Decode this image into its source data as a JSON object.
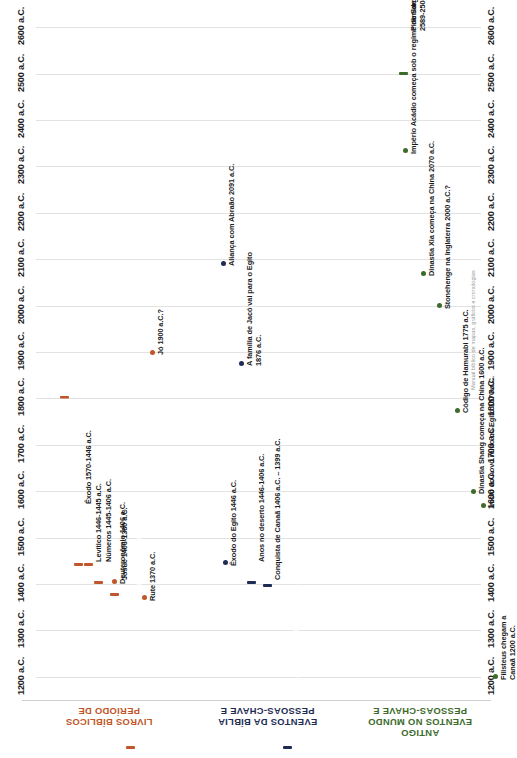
{
  "axis": {
    "unit": "a.C.",
    "ticks": [
      "1200 a.C.",
      "1300 a.C.",
      "1400 a.C.",
      "1500 a.C.",
      "1600 a.C.",
      "1700 a.C.",
      "1800 a.C.",
      "1900 a.C.",
      "2000 a.C.",
      "2100 a.C.",
      "2200 a.C.",
      "2300 a.C.",
      "2400 a.C.",
      "2500 a.C.",
      "2600 a.C."
    ],
    "tick_values": [
      1200,
      1300,
      1400,
      1500,
      1600,
      1700,
      1800,
      1900,
      2000,
      2100,
      2200,
      2300,
      2400,
      2500,
      2600
    ],
    "min": 1150,
    "max": 2620
  },
  "credit": "Manual bíblico de mapas, gráficos e cronologias",
  "rows": [
    {
      "key": "livros",
      "title": "PERÍODO DE\nLIVROS BÍBLICOS",
      "title_line1": "PERÍODO DE",
      "title_line2": "LIVROS BÍBLICOS",
      "color": "#C1562A",
      "color_light": "#D2703F"
    },
    {
      "key": "biblia",
      "title_line1": "PESSOAS-CHAVE E",
      "title_line2": "EVENTOS DA BÍBLIA",
      "color": "#1E2C54",
      "color_light": "#26345E"
    },
    {
      "key": "mundo",
      "title_line1": "PESSOAS-CHAVE E",
      "title_line2": "EVENTOS NO MUNDO",
      "title_line3": "ANTIGO",
      "color": "#3C6B2B",
      "color_light": "#4A7C33"
    }
  ],
  "chart_data": {
    "type": "bar",
    "orientation": "horizontal-time-rotated",
    "xlabel": "",
    "ylabel": "",
    "xlim": [
      2620,
      1150
    ],
    "grid": true,
    "legend": "none",
    "tick_labels": [
      "2600 a.C.",
      "2500 a.C.",
      "2400 a.C.",
      "2300 a.C.",
      "2200 a.C.",
      "2100 a.C.",
      "2000 a.C.",
      "1900 a.C.",
      "1800 a.C.",
      "1700 a.C.",
      "1600 a.C.",
      "1500 a.C.",
      "1400 a.C.",
      "1300 a.C.",
      "1200 a.C."
    ],
    "series": [
      {
        "name": "PERÍODO DE LIVROS BÍBLICOS",
        "color": "#C1562A",
        "bars": [
          {
            "label": "Origem de Gênesis – 1805 a.C.",
            "start": 2600,
            "end": 1805,
            "label_inside": true,
            "gradient": true
          },
          {
            "label": "Êxodo 1570-1446 a.C.",
            "start": 1570,
            "end": 1446,
            "label_inside": false
          },
          {
            "label": "Levítico 1446-1445 a.C.",
            "start": 1446,
            "end": 1445,
            "label_inside": false
          },
          {
            "label": "Números 1445-1406 a.C.",
            "start": 1445,
            "end": 1406,
            "label_inside": false
          },
          {
            "label": "Josué 1406-1380 a.C.",
            "start": 1406,
            "end": 1380,
            "label_inside": false
          },
          {
            "label": "Juízes 1356-1050 a.C.",
            "start": 1356,
            "end": 1050,
            "label_inside": true
          }
        ],
        "points": [
          {
            "label": "Jó 1900 a.C.?",
            "value": 1900
          },
          {
            "label": "Deuteronômio 1406 a.C.",
            "value": 1406
          },
          {
            "label": "Rute 1370 a.C.",
            "value": 1370
          }
        ]
      },
      {
        "name": "PESSOAS-CHAVE E EVENTOS DA BÍBLIA",
        "color": "#1E2C54",
        "bars": [
          {
            "label": "Anos no deserto 1446-1406 a.C.",
            "start": 1446,
            "end": 1406,
            "label_inside": false
          },
          {
            "label": "Conquista de Canaã 1406 a.C. – 1399 a.C.",
            "start": 1406,
            "end": 1399,
            "label_inside": false
          },
          {
            "label": "Os juízes governam Israel 1156- 1050 a.C.",
            "start": 1156,
            "end": 1050,
            "label_inside": true
          }
        ],
        "points": [
          {
            "label": "Aliança com Abraão 2091 a.C.",
            "value": 2091
          },
          {
            "label": "A família de Jacó vai para o Egito\n1876 a.C.",
            "value": 1876
          },
          {
            "label": "Êxodo do Egito 1446 a.C.",
            "value": 1446
          }
        ]
      },
      {
        "name": "PESSOAS-CHAVE E EVENTOS NO MUNDO ANTIGO",
        "color": "#3C6B2B",
        "bars": [
          {
            "label": "Pirâmide construída em Gizé\n2589-2504 a.C.",
            "start": 2589,
            "end": 2504,
            "label_inside": false
          }
        ],
        "points": [
          {
            "label": "Império Acádio começa sob o regime de Sargão 2334 a.C.",
            "value": 2334
          },
          {
            "label": "Dinastia Xia começa na China 2070 a.C.",
            "value": 2070
          },
          {
            "label": "Stonehenge na Inglaterra 2000 a.C.?",
            "value": 2000
          },
          {
            "label": "Código de Hamurabi 1775 a.C.",
            "value": 1775
          },
          {
            "label": "Dinastia Shang começa na China 1600 a.C.",
            "value": 1600
          },
          {
            "label": "Início do novo reino no Egito 1570 a.C.",
            "value": 1570
          },
          {
            "label": "Filisteus chegam a\nCanaã 1200 a.C.",
            "value": 1200
          }
        ]
      }
    ]
  }
}
